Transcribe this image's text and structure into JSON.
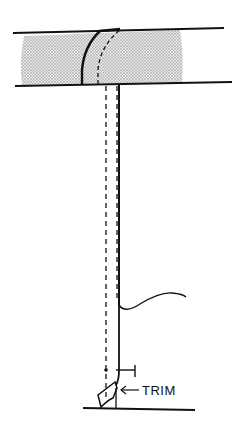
{
  "diagram": {
    "colors": {
      "stroke": "#111111",
      "shade": "#c8c8c8",
      "background": "#ffffff"
    },
    "labels": {
      "trim": "TRIM"
    },
    "annotations": [
      {
        "id": "trim-arrow",
        "text": "TRIM",
        "points_to": "trimmed end of vertical member"
      }
    ]
  }
}
